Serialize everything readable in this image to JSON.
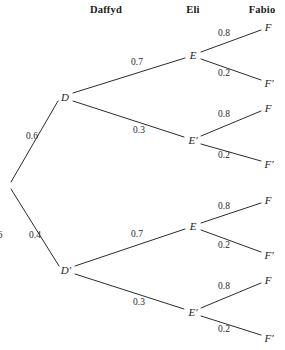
{
  "background_color": "#ffffff",
  "line_color": "#2b2b2b",
  "text_color": "#232323",
  "headers": [
    {
      "label": "Daffyd",
      "x": 106,
      "y": 4
    },
    {
      "label": "Eli",
      "x": 193,
      "y": 4
    },
    {
      "label": "Fabio",
      "x": 262,
      "y": 4
    }
  ],
  "margin_artifact": {
    "text": "6",
    "x": -3,
    "y": 228
  },
  "tree": {
    "root": {
      "x": 9,
      "y": 185
    },
    "nodes": [
      {
        "id": "D",
        "label": "D",
        "x": 65,
        "y": 97,
        "level": 1
      },
      {
        "id": "Dp",
        "label": "D′",
        "x": 66,
        "y": 270,
        "level": 1
      },
      {
        "id": "E1",
        "label": "E",
        "x": 193,
        "y": 55,
        "level": 2
      },
      {
        "id": "E1p",
        "label": "E′",
        "x": 193,
        "y": 140,
        "level": 2
      },
      {
        "id": "E2",
        "label": "E",
        "x": 193,
        "y": 226,
        "level": 2
      },
      {
        "id": "E2p",
        "label": "E′",
        "x": 193,
        "y": 312,
        "level": 2
      },
      {
        "id": "F1",
        "label": "F",
        "x": 268,
        "y": 27,
        "level": 3
      },
      {
        "id": "F1p",
        "label": "F′",
        "x": 269,
        "y": 83,
        "level": 3
      },
      {
        "id": "F2",
        "label": "F",
        "x": 268,
        "y": 108,
        "level": 3
      },
      {
        "id": "F2p",
        "label": "F′",
        "x": 269,
        "y": 164,
        "level": 3
      },
      {
        "id": "F3",
        "label": "F",
        "x": 268,
        "y": 200,
        "level": 3
      },
      {
        "id": "F3p",
        "label": "F′",
        "x": 269,
        "y": 255,
        "level": 3
      },
      {
        "id": "F4",
        "label": "F",
        "x": 268,
        "y": 280,
        "level": 3
      },
      {
        "id": "F4p",
        "label": "F′",
        "x": 269,
        "y": 338,
        "level": 3
      }
    ],
    "branches": [
      {
        "from": "root",
        "to": "D",
        "prob": "0.6",
        "x1": 11,
        "y1": 182,
        "x2": 58,
        "y2": 101,
        "lx": 32,
        "ly": 136
      },
      {
        "from": "root",
        "to": "Dp",
        "prob": "0.4",
        "x1": 11,
        "y1": 189,
        "x2": 59,
        "y2": 266,
        "lx": 35,
        "ly": 235
      },
      {
        "from": "D",
        "to": "E1",
        "prob": "0.7",
        "x1": 73,
        "y1": 93,
        "x2": 185,
        "y2": 58,
        "lx": 137,
        "ly": 62
      },
      {
        "from": "D",
        "to": "E1p",
        "prob": "0.3",
        "x1": 73,
        "y1": 101,
        "x2": 184,
        "y2": 137,
        "lx": 139,
        "ly": 130
      },
      {
        "from": "Dp",
        "to": "E2",
        "prob": "0.7",
        "x1": 75,
        "y1": 266,
        "x2": 185,
        "y2": 229,
        "lx": 137,
        "ly": 234
      },
      {
        "from": "Dp",
        "to": "E2p",
        "prob": "0.3",
        "x1": 75,
        "y1": 274,
        "x2": 184,
        "y2": 309,
        "lx": 139,
        "ly": 302
      },
      {
        "from": "E1",
        "to": "F1",
        "prob": "0.8",
        "x1": 201,
        "y1": 52,
        "x2": 261,
        "y2": 30,
        "lx": 224,
        "ly": 33
      },
      {
        "from": "E1",
        "to": "F1p",
        "prob": "0.2",
        "x1": 201,
        "y1": 59,
        "x2": 261,
        "y2": 80,
        "lx": 224,
        "ly": 73
      },
      {
        "from": "E1p",
        "to": "F2",
        "prob": "0.8",
        "x1": 201,
        "y1": 136,
        "x2": 261,
        "y2": 111,
        "lx": 224,
        "ly": 114
      },
      {
        "from": "E1p",
        "to": "F2p",
        "prob": "0.2",
        "x1": 201,
        "y1": 144,
        "x2": 261,
        "y2": 161,
        "lx": 224,
        "ly": 155
      },
      {
        "from": "E2",
        "to": "F3",
        "prob": "0.8",
        "x1": 201,
        "y1": 223,
        "x2": 261,
        "y2": 203,
        "lx": 224,
        "ly": 206
      },
      {
        "from": "E2",
        "to": "F3p",
        "prob": "0.2",
        "x1": 201,
        "y1": 230,
        "x2": 261,
        "y2": 252,
        "lx": 224,
        "ly": 245
      },
      {
        "from": "E2p",
        "to": "F4",
        "prob": "0.8",
        "x1": 201,
        "y1": 308,
        "x2": 261,
        "y2": 283,
        "lx": 224,
        "ly": 286
      },
      {
        "from": "E2p",
        "to": "F4p",
        "prob": "0.2",
        "x1": 201,
        "y1": 316,
        "x2": 261,
        "y2": 335,
        "lx": 224,
        "ly": 329
      }
    ]
  }
}
